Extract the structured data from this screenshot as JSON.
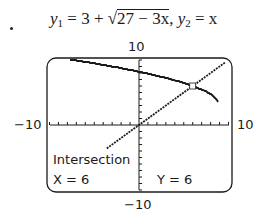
{
  "title": {
    "y1_label": "y",
    "y1_sub": "1",
    "y1_lhs": " = 3 + ",
    "y1_radical": "√",
    "y1_radicand": "27 − 3x",
    "separator": ",  ",
    "y2_label": "y",
    "y2_sub": "2",
    "y2_rhs": " = x"
  },
  "window": {
    "ymax_label": "10",
    "ymin_label": "−10",
    "xmin_label": "−10",
    "xmax_label": "10"
  },
  "readout": {
    "heading": "Intersection",
    "x": "X = 6",
    "y": "Y = 6"
  },
  "chart_data": {
    "type": "line",
    "xlabel": "",
    "ylabel": "",
    "xlim": [
      -10,
      10
    ],
    "ylim": [
      -10,
      10
    ],
    "xscale": 1,
    "yscale": 1,
    "grid": false,
    "series": [
      {
        "name": "y1 = 3 + √(27 − 3x)",
        "x": [
          -10,
          -8,
          -6,
          -4,
          -2,
          0,
          2,
          4,
          6,
          8,
          9
        ],
        "values": [
          10.43,
          10.14,
          9.71,
          9.24,
          8.74,
          8.2,
          7.58,
          6.87,
          6.0,
          4.73,
          3.0
        ]
      },
      {
        "name": "y2 = x",
        "x": [
          -10,
          -5,
          0,
          5,
          10
        ],
        "values": [
          -10,
          -5,
          0,
          5,
          10
        ]
      }
    ],
    "annotations": [
      {
        "text": "Intersection",
        "x": 6,
        "y": 6
      },
      {
        "text": "X = 6"
      },
      {
        "text": "Y = 6"
      }
    ]
  }
}
